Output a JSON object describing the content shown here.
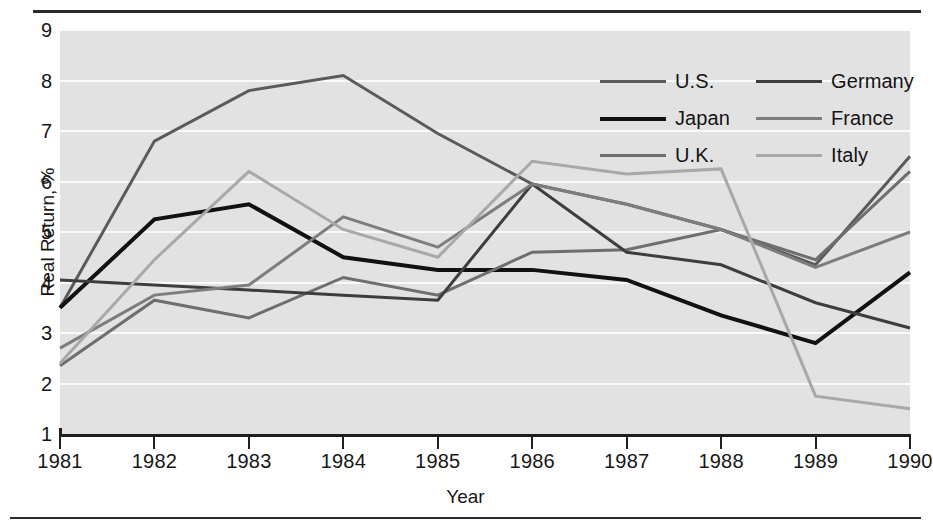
{
  "chart_data": {
    "type": "line",
    "title": "",
    "xlabel": "Year",
    "ylabel": "Real Return, %",
    "x": [
      1981,
      1982,
      1983,
      1984,
      1985,
      1986,
      1987,
      1988,
      1989,
      1990
    ],
    "xticklabels": [
      "1981",
      "1982",
      "1983",
      "1984",
      "1985",
      "1986",
      "1987",
      "1988",
      "1989",
      "1990"
    ],
    "yticklabels": [
      "1",
      "2",
      "3",
      "4",
      "5",
      "6",
      "7",
      "8",
      "9"
    ],
    "ylim": [
      1,
      9
    ],
    "xlim": [
      1981,
      1990
    ],
    "grid": "horizontal",
    "legend_position": "top-right",
    "legend_columns": 2,
    "plot_background": "#e2e2e2",
    "series": [
      {
        "name": "U.S.",
        "color": "#5a5a5a",
        "width": 3,
        "values": [
          3.5,
          6.8,
          7.8,
          8.1,
          6.95,
          5.95,
          5.55,
          5.05,
          4.35,
          6.5
        ]
      },
      {
        "name": "Japan",
        "color": "#111111",
        "width": 4,
        "values": [
          3.5,
          5.25,
          5.55,
          4.5,
          4.25,
          4.25,
          4.05,
          3.35,
          2.8,
          4.2
        ]
      },
      {
        "name": "U.K.",
        "color": "#6e6e6e",
        "width": 3,
        "values": [
          2.35,
          3.65,
          3.3,
          4.1,
          3.75,
          4.6,
          4.65,
          5.05,
          4.45,
          6.2
        ]
      },
      {
        "name": "Germany",
        "color": "#3d3d3d",
        "width": 3,
        "values": [
          4.05,
          3.95,
          3.85,
          3.75,
          3.65,
          5.95,
          4.6,
          4.35,
          3.6,
          3.1
        ]
      },
      {
        "name": "France",
        "color": "#7d7d7d",
        "width": 3,
        "values": [
          2.7,
          3.75,
          3.95,
          5.3,
          4.7,
          5.95,
          5.55,
          5.05,
          4.3,
          5.0
        ]
      },
      {
        "name": "Italy",
        "color": "#a8a8a8",
        "width": 3,
        "values": [
          2.4,
          4.45,
          6.2,
          5.05,
          4.5,
          6.4,
          6.15,
          6.25,
          1.75,
          1.5
        ]
      }
    ]
  }
}
